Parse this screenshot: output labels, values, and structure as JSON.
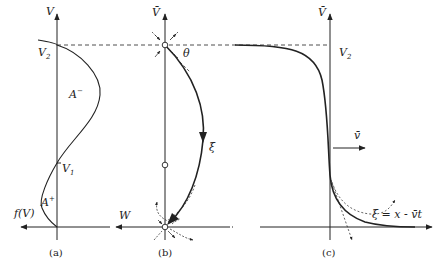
{
  "panels": {
    "a": {
      "caption": "(a)",
      "axis_v": "V",
      "axis_h": "f(V)",
      "v2": "V",
      "v2_sub": "2",
      "v1": "V",
      "v1_sub": "1",
      "area_minus": "A",
      "area_minus_sup": "−",
      "area_plus": "A",
      "area_plus_sup": "+"
    },
    "b": {
      "caption": "(b)",
      "axis_v": "V̄",
      "axis_h": "W",
      "angle": "θ",
      "trajectory": "ξ"
    },
    "c": {
      "caption": "(c)",
      "axis_v": "V̄",
      "v2": "V",
      "v2_sub": "2",
      "velocity": "v̄",
      "axis_h": "ξ = x - v̄t"
    }
  },
  "colors": {
    "ink": "#222222",
    "background": "#ffffff"
  }
}
